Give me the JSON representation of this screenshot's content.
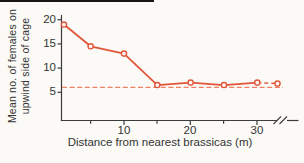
{
  "figure": {
    "background": "#fbfaf6"
  },
  "chart_data": {
    "type": "line",
    "title": "",
    "xlabel": "Distance from nearest brassicas (m)",
    "ylabel": "Mean no. of females on upwind side of cage",
    "ylabel_lines": [
      "Mean no. of females on",
      "upwind side of cage"
    ],
    "x_tick_labels": [
      "10",
      "20",
      "30"
    ],
    "y_tick_labels": [
      "20",
      "15",
      "10",
      "5"
    ],
    "xlim": [
      0,
      33
    ],
    "ylim": [
      0,
      21
    ],
    "x_axis_break_after": 30,
    "grid": false,
    "legend": "none",
    "series": [
      {
        "name": "females upwind",
        "marker": "open-circle",
        "points": [
          {
            "x": 1,
            "y": 19
          },
          {
            "x": 5,
            "y": 14.5
          },
          {
            "x": 10,
            "y": 13
          },
          {
            "x": 15,
            "y": 6.5
          },
          {
            "x": 20,
            "y": 7
          },
          {
            "x": 25,
            "y": 6.5
          },
          {
            "x": 30,
            "y": 7
          }
        ],
        "far_point_beyond_break": {
          "y": 6.8
        }
      }
    ],
    "reference_line": {
      "y": 6,
      "style": "dashed",
      "orientation": "horizontal"
    },
    "line_color": "#e2553a",
    "ref_line_color": "#ed8266",
    "axis_color": "#3c3c3c"
  }
}
